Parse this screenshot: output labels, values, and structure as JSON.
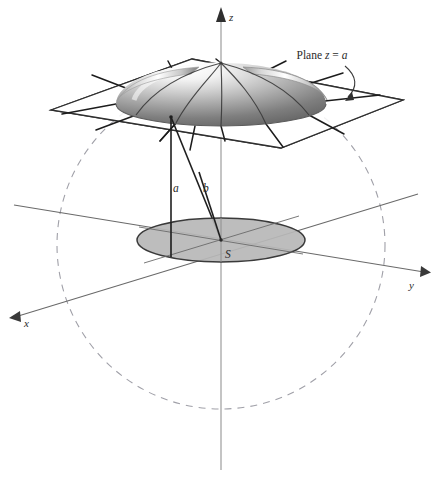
{
  "figure": {
    "background_color": "#ffffff",
    "axes": {
      "x": {
        "label": "x",
        "label_x": 24,
        "label_y": 324,
        "arrow_tip": [
          12,
          316
        ],
        "origin": [
          221,
          240
        ],
        "far_end": [
          410,
          196
        ]
      },
      "y": {
        "label": "y",
        "label_x": 411,
        "label_y": 287,
        "arrow_tip": [
          429,
          271
        ],
        "origin": [
          221,
          240
        ],
        "far_end": [
          16,
          206
        ]
      },
      "z": {
        "label": "z",
        "label_x": 228,
        "label_y": 18,
        "arrow_tip": [
          221,
          8
        ],
        "origin": [
          221,
          240
        ],
        "bottom_end": [
          221,
          470
        ]
      }
    },
    "annotations": [
      {
        "name": "plane-label",
        "prefix": "Plane ",
        "var1": "z",
        "eq": " = ",
        "var2": "a",
        "x": 322,
        "y": 59
      },
      {
        "name": "segment-a-label",
        "text": "a",
        "x": 173,
        "y": 192
      },
      {
        "name": "segment-b-label",
        "text": "b",
        "x": 202,
        "y": 192
      },
      {
        "name": "region-s-label",
        "text": "S",
        "x": 225,
        "y": 257
      }
    ],
    "plane": {
      "name": "cutting-plane",
      "corners": [
        [
          51,
          110
        ],
        [
          192,
          59
        ],
        [
          403,
          100
        ],
        [
          281,
          148
        ]
      ],
      "stroke": "#2f2f2f",
      "fill": "none"
    },
    "dome": {
      "name": "dome-surface",
      "apex": [
        221,
        63
      ],
      "base_center": [
        221,
        104
      ],
      "base_rx": 105,
      "base_ry": 22,
      "shading_light": "#fcfcfc",
      "shading_dark": "#6e6e6e"
    },
    "region_s": {
      "name": "region-s-disk",
      "center": [
        221,
        240
      ],
      "rx": 84,
      "ry": 22,
      "fill": "#b5b5b5",
      "stroke": "#3a3a3a"
    },
    "sphere_outline": {
      "name": "sphere-dashed-circle",
      "center": [
        221,
        245
      ],
      "radius": 164,
      "stroke": "#9a9aa2",
      "dash": "7 6"
    },
    "segments": [
      {
        "name": "segment-a",
        "from": [
          171,
          117
        ],
        "to": [
          171,
          257
        ],
        "stroke": "#1f1f1f"
      },
      {
        "name": "segment-b",
        "from": [
          171,
          117
        ],
        "to": [
          221,
          240
        ],
        "stroke": "#1f1f1f"
      }
    ],
    "colors": {
      "ink": "#2b2b2b",
      "line": "#3a3a3a",
      "faint": "#9a9aa2",
      "disk_fill": "#b5b5b5"
    }
  }
}
